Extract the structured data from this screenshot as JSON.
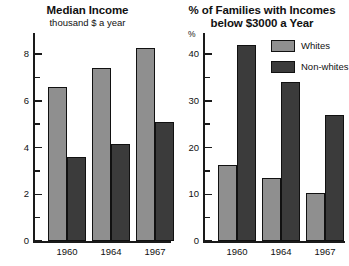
{
  "figure": {
    "background": "#ffffff",
    "ink_color": "#111111"
  },
  "legend": {
    "position": "top-right",
    "entries": [
      {
        "label": "Whites",
        "color": "#8f8f8f"
      },
      {
        "label": "Non-whites",
        "color": "#3b3b3b"
      }
    ]
  },
  "chart_data": [
    {
      "type": "bar",
      "title": "Median Income",
      "subtitle": "thousand $ a year",
      "xlabel": "",
      "ylabel": "",
      "yunit": "",
      "categories": [
        "1960",
        "1964",
        "1967"
      ],
      "series": [
        {
          "name": "Whites",
          "color": "#8f8f8f",
          "values": [
            6.6,
            7.4,
            8.25
          ]
        },
        {
          "name": "Non-whites",
          "color": "#3b3b3b",
          "values": [
            3.6,
            4.15,
            5.1
          ]
        }
      ],
      "ylim": [
        0,
        8.9
      ],
      "yticks": [
        0,
        2,
        4,
        6,
        8
      ],
      "yticklabels": [
        "0",
        "2",
        "4",
        "6",
        "8"
      ],
      "yminorticks": [
        1,
        3,
        5,
        7
      ],
      "grid": false
    },
    {
      "type": "bar",
      "title": "% of Families with Incomes",
      "subtitle": "below $3000 a Year",
      "xlabel": "",
      "ylabel": "",
      "yunit": "%",
      "categories": [
        "1960",
        "1964",
        "1967"
      ],
      "series": [
        {
          "name": "Whites",
          "color": "#8f8f8f",
          "values": [
            16.3,
            13.5,
            10.3
          ]
        },
        {
          "name": "Non-whites",
          "color": "#3b3b3b",
          "values": [
            42.0,
            34.0,
            27.0
          ]
        }
      ],
      "ylim": [
        0,
        44.5
      ],
      "yticks": [
        0,
        10,
        20,
        30,
        40
      ],
      "yticklabels": [
        "0",
        "10",
        "20",
        "30",
        "40"
      ],
      "yminorticks": [
        5,
        15,
        25,
        35
      ],
      "grid": false
    }
  ]
}
